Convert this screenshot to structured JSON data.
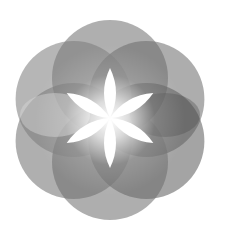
{
  "image": {
    "title": "Flower of life logo",
    "description": "Six overlapping gray circles arranged in a hexagonal rosette with a white glowing six-petal flower at the center"
  },
  "logo": {
    "center": [
      110,
      120
    ],
    "circle_radius": 58,
    "center_distance": 42,
    "circles": [
      {
        "angle": -90,
        "fill": "#6e6e6e"
      },
      {
        "angle": -30,
        "fill": "#6a6a6a"
      },
      {
        "angle": 30,
        "fill": "#5a5a5a"
      },
      {
        "angle": 90,
        "fill": "#6c6c6c"
      },
      {
        "angle": 150,
        "fill": "#6e6e6e"
      },
      {
        "angle": 210,
        "fill": "#7a7a7a"
      }
    ],
    "colors": {
      "background": "#ffffff",
      "petal": "#ffffff",
      "dark_shade": "#4a4a4a",
      "light_shade": "#d8d8d8"
    }
  }
}
